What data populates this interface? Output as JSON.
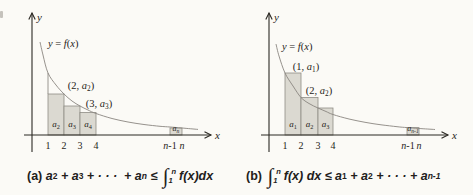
{
  "colors": {
    "background": "#fbfaf6",
    "ink": "#2b2823",
    "curve": "#8a8680",
    "rect_fill": "#dbd9d1",
    "rect_stroke": "#8f8d86",
    "text": "#262420"
  },
  "panels": [
    {
      "name": "a",
      "y_axis": {
        "x": 32,
        "top": 13,
        "bottom": 152,
        "label": "y",
        "label_x": 37,
        "label_y": 21
      },
      "x_axis": {
        "y": 135,
        "left": 24,
        "right": 211,
        "label": "x",
        "label_x": 215,
        "label_y": 139
      },
      "curve": [
        [
          40,
          42
        ],
        [
          43,
          55
        ],
        [
          48,
          73
        ],
        [
          56,
          85
        ],
        [
          64,
          94
        ],
        [
          72,
          101
        ],
        [
          80,
          106
        ],
        [
          88,
          110
        ],
        [
          96,
          113.5
        ],
        [
          112,
          118.5
        ],
        [
          128,
          122
        ],
        [
          144,
          124.5
        ],
        [
          160,
          126.3
        ],
        [
          170,
          127
        ],
        [
          182,
          128
        ],
        [
          198,
          129.4
        ]
      ],
      "curve_label": {
        "x": 48,
        "y": 47,
        "segs": [
          {
            "t": "y",
            "s": "i"
          },
          {
            "t": " = ",
            "s": ""
          },
          {
            "t": "f",
            "s": "i"
          },
          {
            "t": "(",
            "s": ""
          },
          {
            "t": "x",
            "s": "i"
          },
          {
            "t": ")",
            "s": ""
          }
        ]
      },
      "point_labels": [
        {
          "x": 81,
          "y": 89,
          "segs": [
            {
              "t": "(2, ",
              "s": ""
            },
            {
              "t": "a",
              "s": "i"
            },
            {
              "t": "2",
              "s": "sub"
            },
            {
              "t": ")",
              "s": ""
            }
          ]
        },
        {
          "x": 99,
          "y": 107,
          "segs": [
            {
              "t": "(3, ",
              "s": ""
            },
            {
              "t": "a",
              "s": "i"
            },
            {
              "t": "3",
              "s": "sub"
            },
            {
              "t": ")",
              "s": ""
            }
          ]
        }
      ],
      "rects": [
        {
          "x1": 48,
          "x2": 64,
          "top": 94,
          "label_x": 56,
          "label_y": 127,
          "fs": 9,
          "segs": [
            {
              "t": "a",
              "s": "i"
            },
            {
              "t": "2",
              "s": "sub"
            }
          ]
        },
        {
          "x1": 64,
          "x2": 80,
          "top": 106,
          "label_x": 72,
          "label_y": 127,
          "fs": 9,
          "segs": [
            {
              "t": "a",
              "s": "i"
            },
            {
              "t": "3",
              "s": "sub"
            }
          ]
        },
        {
          "x1": 80,
          "x2": 96,
          "top": 112.5,
          "label_x": 88,
          "label_y": 127,
          "fs": 9,
          "segs": [
            {
              "t": "a",
              "s": "i"
            },
            {
              "t": "4",
              "s": "sub"
            }
          ]
        },
        {
          "x1": 170,
          "x2": 182,
          "top": 128,
          "label_x": 176,
          "label_y": 131,
          "fs": 8,
          "segs": [
            {
              "t": "a",
              "s": "i"
            },
            {
              "t": "n",
              "s": "subi"
            }
          ]
        }
      ],
      "extra_lines": [
        {
          "x": 48,
          "y1": 73,
          "y2": 94
        }
      ],
      "tick_y": 149,
      "ticks": [
        {
          "x": 48,
          "segs": [
            {
              "t": "1",
              "s": ""
            }
          ]
        },
        {
          "x": 64,
          "segs": [
            {
              "t": "2",
              "s": ""
            }
          ]
        },
        {
          "x": 80,
          "segs": [
            {
              "t": "3",
              "s": ""
            }
          ]
        },
        {
          "x": 96,
          "segs": [
            {
              "t": "4",
              "s": ""
            }
          ]
        },
        {
          "x": 170,
          "segs": [
            {
              "t": "n",
              "s": "i"
            },
            {
              "t": "-1",
              "s": ""
            }
          ]
        },
        {
          "x": 182,
          "segs": [
            {
              "t": "n",
              "s": "i"
            }
          ]
        }
      ]
    },
    {
      "name": "b",
      "y_axis": {
        "x": 269,
        "top": 13,
        "bottom": 152,
        "label": "y",
        "label_x": 274,
        "label_y": 21
      },
      "x_axis": {
        "y": 135,
        "left": 261,
        "right": 448,
        "label": "x",
        "label_x": 452,
        "label_y": 139
      },
      "curve": [
        [
          276,
          44
        ],
        [
          279,
          56
        ],
        [
          285,
          73
        ],
        [
          293,
          86
        ],
        [
          301,
          97.5
        ],
        [
          309,
          103.5
        ],
        [
          318,
          108
        ],
        [
          326,
          111.5
        ],
        [
          333,
          114.5
        ],
        [
          349,
          119
        ],
        [
          365,
          122.3
        ],
        [
          381,
          124.8
        ],
        [
          397,
          126.7
        ],
        [
          407,
          127.6
        ],
        [
          419,
          128.5
        ],
        [
          435,
          129.5
        ]
      ],
      "curve_label": {
        "x": 282,
        "y": 50,
        "segs": [
          {
            "t": "y",
            "s": "i"
          },
          {
            "t": " = ",
            "s": ""
          },
          {
            "t": "f",
            "s": "i"
          },
          {
            "t": "(",
            "s": ""
          },
          {
            "t": "x",
            "s": "i"
          },
          {
            "t": ")",
            "s": ""
          }
        ]
      },
      "point_labels": [
        {
          "x": 306,
          "y": 70,
          "segs": [
            {
              "t": "(1, ",
              "s": ""
            },
            {
              "t": "a",
              "s": "i"
            },
            {
              "t": "1",
              "s": "sub"
            },
            {
              "t": ")",
              "s": ""
            }
          ]
        },
        {
          "x": 319,
          "y": 94,
          "segs": [
            {
              "t": "(2, ",
              "s": ""
            },
            {
              "t": "a",
              "s": "i"
            },
            {
              "t": "2",
              "s": "sub"
            },
            {
              "t": ")",
              "s": ""
            }
          ]
        }
      ],
      "rects": [
        {
          "x1": 285,
          "x2": 301,
          "top": 73,
          "label_x": 293,
          "label_y": 127,
          "fs": 9,
          "segs": [
            {
              "t": "a",
              "s": "i"
            },
            {
              "t": "1",
              "s": "sub"
            }
          ]
        },
        {
          "x1": 301,
          "x2": 318,
          "top": 97.5,
          "label_x": 309.5,
          "label_y": 127,
          "fs": 9,
          "segs": [
            {
              "t": "a",
              "s": "i"
            },
            {
              "t": "2",
              "s": "sub"
            }
          ]
        },
        {
          "x1": 318,
          "x2": 333,
          "top": 108,
          "label_x": 325.5,
          "label_y": 127,
          "fs": 9,
          "segs": [
            {
              "t": "a",
              "s": "i"
            },
            {
              "t": "3",
              "s": "sub"
            }
          ]
        },
        {
          "x1": 407,
          "x2": 419,
          "top": 127.6,
          "label_x": 413,
          "label_y": 131,
          "fs": 8,
          "segs": [
            {
              "t": "a",
              "s": "i"
            },
            {
              "t": "n-1",
              "s": "subi"
            }
          ]
        }
      ],
      "extra_lines": [],
      "tick_y": 149,
      "ticks": [
        {
          "x": 285,
          "segs": [
            {
              "t": "1",
              "s": ""
            }
          ]
        },
        {
          "x": 301,
          "segs": [
            {
              "t": "2",
              "s": ""
            }
          ]
        },
        {
          "x": 318,
          "segs": [
            {
              "t": "3",
              "s": ""
            }
          ]
        },
        {
          "x": 333,
          "segs": [
            {
              "t": "4",
              "s": ""
            }
          ]
        },
        {
          "x": 408,
          "segs": [
            {
              "t": "n",
              "s": "i"
            },
            {
              "t": "-1",
              "s": ""
            }
          ]
        },
        {
          "x": 419,
          "segs": [
            {
              "t": "n",
              "s": "i"
            }
          ]
        }
      ]
    }
  ],
  "captions": {
    "a": {
      "segments": [
        {
          "t": "(a) ",
          "s": "b"
        },
        {
          "t": "a",
          "s": "bi"
        },
        {
          "t": "2",
          "s": "bsub"
        },
        {
          "t": " + ",
          "s": "bi"
        },
        {
          "t": "a",
          "s": "bi"
        },
        {
          "t": "3",
          "s": "bsub"
        },
        {
          "t": " + · · ·  + ",
          "s": "bi"
        },
        {
          "t": "a",
          "s": "bi"
        },
        {
          "t": "n",
          "s": "bsubi"
        },
        {
          "t": " ≤ ",
          "s": "bi"
        },
        {
          "t": "∫",
          "s": "int"
        },
        {
          "t": "n|1",
          "s": "lims"
        },
        {
          "t": "f(x)dx",
          "s": "bi"
        }
      ]
    },
    "b": {
      "segments": [
        {
          "t": "(b) ",
          "s": "b"
        },
        {
          "t": "∫",
          "s": "int"
        },
        {
          "t": "n|1",
          "s": "lims"
        },
        {
          "t": "f(x) dx ≤ ",
          "s": "bi"
        },
        {
          "t": "a",
          "s": "bi"
        },
        {
          "t": "1",
          "s": "bsub"
        },
        {
          "t": " + ",
          "s": "bi"
        },
        {
          "t": "a",
          "s": "bi"
        },
        {
          "t": "2",
          "s": "bsub"
        },
        {
          "t": " + · · · + ",
          "s": "bi"
        },
        {
          "t": "a",
          "s": "bi"
        },
        {
          "t": "n-1",
          "s": "bsubi"
        }
      ]
    }
  }
}
